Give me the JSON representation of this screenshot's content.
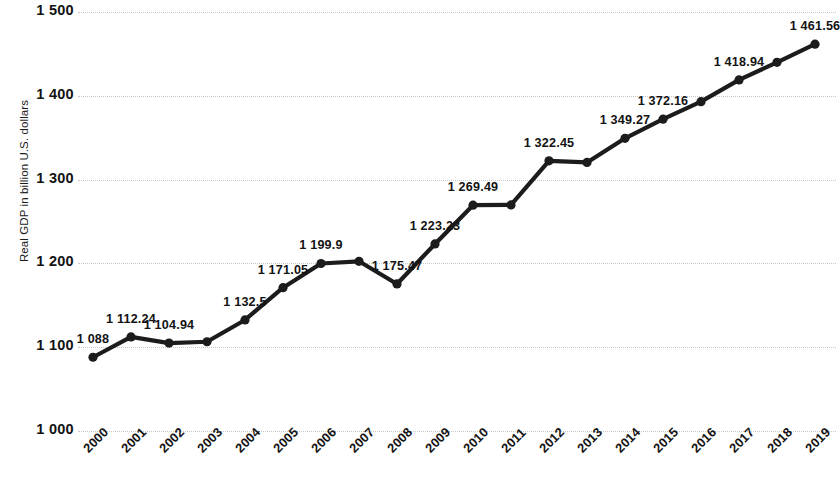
{
  "chart_data": {
    "type": "line",
    "title": "",
    "subtitle": "",
    "xlabel": "",
    "ylabel": "Real GDP in billion U.S. dollars",
    "ylim": [
      1000,
      1500
    ],
    "y_ticks": [
      "1 000",
      "1 100",
      "1 200",
      "1 300",
      "1 400",
      "1 500"
    ],
    "y_tick_values": [
      1000,
      1100,
      1200,
      1300,
      1400,
      1500
    ],
    "grid": "horizontal-dotted",
    "legend": "none",
    "categories": [
      "2000",
      "2001",
      "2002",
      "2003",
      "2004",
      "2005",
      "2006",
      "2007",
      "2008",
      "2009",
      "2010",
      "2011",
      "2012",
      "2013",
      "2014",
      "2015",
      "2016",
      "2017",
      "2018",
      "2019"
    ],
    "values": [
      1088,
      1112.24,
      1104.94,
      1106.5,
      1132.5,
      1171.05,
      1199.9,
      1202.5,
      1175.47,
      1223.23,
      1269.49,
      1269.8,
      1322.45,
      1320.5,
      1349.27,
      1372.16,
      1393.0,
      1418.94,
      1440.0,
      1461.56
    ],
    "point_labels": [
      "1 088",
      "1 112.24",
      "1 104.94",
      "",
      "1 132.5",
      "1 171.05",
      "1 199.9",
      "",
      "1 175.47",
      "1 223.23",
      "1 269.49",
      "",
      "1 322.45",
      "",
      "1 349.27",
      "1 372.16",
      "",
      "1 418.94",
      "",
      "1 461.56"
    ],
    "series_color": "#1c1c1c",
    "marker": "circle",
    "marker_color": "#1c1c1c",
    "grid_color": "#c9c9c9",
    "background": "#ffffff"
  }
}
